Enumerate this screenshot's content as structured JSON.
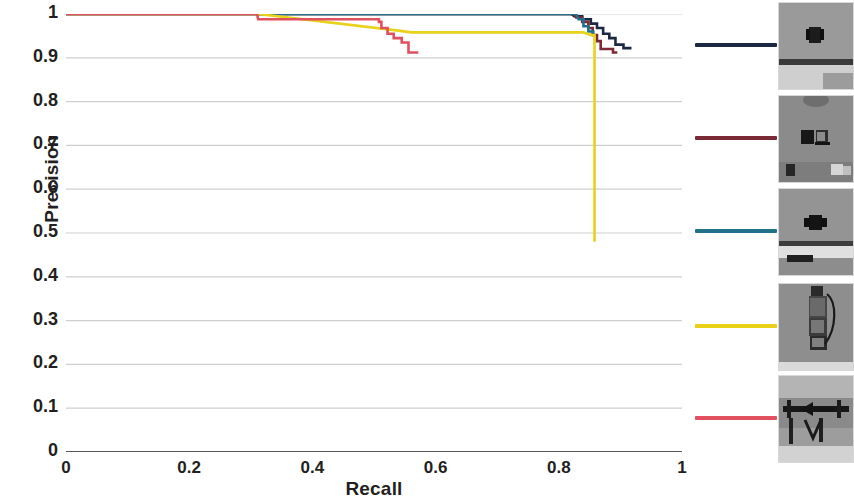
{
  "chart_data": {
    "type": "line",
    "title": "",
    "xlabel": "Recall",
    "ylabel": "Precision",
    "xlim": [
      0,
      1
    ],
    "ylim": [
      0,
      1
    ],
    "xticks": [
      "0",
      "0.2",
      "0.4",
      "0.6",
      "0.8",
      "1"
    ],
    "xtick_values": [
      0,
      0.2,
      0.4,
      0.6,
      0.8,
      1
    ],
    "yticks": [
      "0",
      "0.1",
      "0.2",
      "0.3",
      "0.4",
      "0.5",
      "0.6",
      "0.7",
      "0.8",
      "0.9",
      "1"
    ],
    "ytick_values": [
      0,
      0.1,
      0.2,
      0.3,
      0.4,
      0.5,
      0.6,
      0.7,
      0.8,
      0.9,
      1
    ],
    "grid": true,
    "grid_axis": "y",
    "legend_position": "right",
    "series": [
      {
        "name": "object-1",
        "color": "#1d2944",
        "legend_thumb": "clip-on-table-thumb",
        "points": [
          [
            0.0,
            1.0
          ],
          [
            0.82,
            1.0
          ],
          [
            0.825,
            0.995
          ],
          [
            0.838,
            0.995
          ],
          [
            0.838,
            0.988
          ],
          [
            0.852,
            0.988
          ],
          [
            0.852,
            0.978
          ],
          [
            0.862,
            0.978
          ],
          [
            0.862,
            0.968
          ],
          [
            0.872,
            0.968
          ],
          [
            0.872,
            0.955
          ],
          [
            0.882,
            0.955
          ],
          [
            0.882,
            0.945
          ],
          [
            0.892,
            0.945
          ],
          [
            0.892,
            0.93
          ],
          [
            0.905,
            0.93
          ],
          [
            0.905,
            0.922
          ],
          [
            0.918,
            0.922
          ]
        ]
      },
      {
        "name": "object-2",
        "color": "#7b2b35",
        "legend_thumb": "clips-on-desk-thumb",
        "points": [
          [
            0.0,
            1.0
          ],
          [
            0.825,
            1.0
          ],
          [
            0.828,
            0.992
          ],
          [
            0.838,
            0.992
          ],
          [
            0.838,
            0.982
          ],
          [
            0.848,
            0.982
          ],
          [
            0.848,
            0.968
          ],
          [
            0.855,
            0.968
          ],
          [
            0.855,
            0.952
          ],
          [
            0.862,
            0.952
          ],
          [
            0.862,
            0.938
          ],
          [
            0.868,
            0.938
          ],
          [
            0.868,
            0.92
          ],
          [
            0.888,
            0.92
          ],
          [
            0.888,
            0.912
          ],
          [
            0.895,
            0.912
          ]
        ]
      },
      {
        "name": "object-3",
        "color": "#21718c",
        "legend_thumb": "clip-closeup-thumb",
        "points": [
          [
            0.0,
            1.0
          ],
          [
            0.828,
            1.0
          ],
          [
            0.832,
            0.988
          ],
          [
            0.84,
            0.988
          ],
          [
            0.84,
            0.972
          ],
          [
            0.848,
            0.972
          ],
          [
            0.848,
            0.96
          ],
          [
            0.856,
            0.96
          ],
          [
            0.856,
            0.952
          ]
        ]
      },
      {
        "name": "object-4",
        "color": "#e8d21a",
        "legend_thumb": "stacked-clips-thumb",
        "points": [
          [
            0.0,
            1.0
          ],
          [
            0.312,
            1.0
          ],
          [
            0.54,
            0.962
          ],
          [
            0.56,
            0.958
          ],
          [
            0.84,
            0.958
          ],
          [
            0.852,
            0.952
          ],
          [
            0.858,
            0.952
          ],
          [
            0.858,
            0.48
          ]
        ]
      },
      {
        "name": "object-5",
        "color": "#e0505f",
        "legend_thumb": "arrow-sign-thumb",
        "points": [
          [
            0.0,
            1.0
          ],
          [
            0.31,
            1.0
          ],
          [
            0.312,
            0.988
          ],
          [
            0.508,
            0.988
          ],
          [
            0.508,
            0.982
          ],
          [
            0.512,
            0.982
          ],
          [
            0.512,
            0.968
          ],
          [
            0.522,
            0.968
          ],
          [
            0.522,
            0.955
          ],
          [
            0.532,
            0.955
          ],
          [
            0.532,
            0.945
          ],
          [
            0.545,
            0.945
          ],
          [
            0.545,
            0.935
          ],
          [
            0.556,
            0.935
          ],
          [
            0.556,
            0.912
          ],
          [
            0.572,
            0.912
          ]
        ]
      }
    ]
  },
  "axes": {
    "xlabel": "Recall",
    "ylabel": "Precision"
  },
  "legend": {
    "rows": [
      {
        "name": "legend-row-1",
        "color": "#1d2944",
        "thumb": "clip-on-table-thumb"
      },
      {
        "name": "legend-row-2",
        "color": "#7b2b35",
        "thumb": "clips-on-desk-thumb"
      },
      {
        "name": "legend-row-3",
        "color": "#21718c",
        "thumb": "clip-closeup-thumb"
      },
      {
        "name": "legend-row-4",
        "color": "#e8d21a",
        "thumb": "stacked-clips-thumb"
      },
      {
        "name": "legend-row-5",
        "color": "#e0505f",
        "thumb": "arrow-sign-thumb"
      }
    ]
  },
  "colors": {
    "axis": "#6d6d6d",
    "grid": "#cfcfcf",
    "text": "#231f20",
    "baseline": "#555555"
  }
}
